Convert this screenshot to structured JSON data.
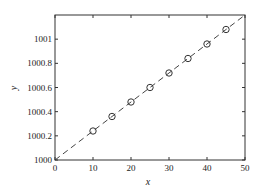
{
  "chart_data": {
    "type": "scatter",
    "title": "",
    "xlabel": "x",
    "ylabel": "y",
    "xlim": [
      0,
      50
    ],
    "ylim": [
      1000,
      1001.2
    ],
    "xticks": [
      0,
      10,
      20,
      30,
      40,
      50
    ],
    "yticks": [
      1000,
      1000.2,
      1000.4,
      1000.6,
      1000.8,
      1001
    ],
    "ytick_labels": [
      "1000",
      "1000.2",
      "1000.4",
      "1000.6",
      "1000.8",
      "1001"
    ],
    "grid": false,
    "legend": null,
    "series": [
      {
        "name": "data",
        "style": "circle-markers",
        "x": [
          10,
          15,
          20,
          25,
          30,
          35,
          40,
          45
        ],
        "y": [
          1000.24,
          1000.36,
          1000.48,
          1000.6,
          1000.72,
          1000.84,
          1000.96,
          1001.08
        ]
      },
      {
        "name": "fit",
        "style": "dashed-line",
        "x": [
          0,
          50
        ],
        "y": [
          1000,
          1001.2
        ]
      }
    ]
  }
}
